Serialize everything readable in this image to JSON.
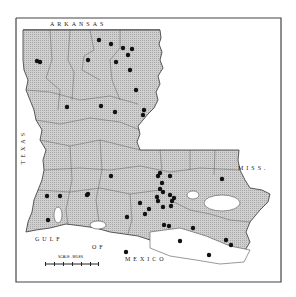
{
  "map": {
    "title": "",
    "labels": {
      "north": "ARKANSAS",
      "west": "TEXAS",
      "east": "MISS.",
      "gulf_1": "GULF",
      "gulf_2": "OF",
      "gulf_3": "MEXICO"
    },
    "scale": {
      "label": "SCALE - MILES"
    },
    "colors": {
      "land": "#c8c8c8",
      "border": "#333333",
      "dot": "#111111",
      "water": "#ffffff",
      "frame": "#444444"
    },
    "dots": [
      [
        99,
        40
      ],
      [
        111,
        44
      ],
      [
        123,
        48
      ],
      [
        132,
        49
      ],
      [
        128,
        55
      ],
      [
        116,
        62
      ],
      [
        130,
        70
      ],
      [
        136,
        90
      ],
      [
        88,
        60
      ],
      [
        40,
        62
      ],
      [
        37,
        61
      ],
      [
        67,
        107
      ],
      [
        101,
        106
      ],
      [
        115,
        112
      ],
      [
        144,
        110
      ],
      [
        143,
        115
      ],
      [
        111,
        176
      ],
      [
        88,
        194
      ],
      [
        158,
        176
      ],
      [
        160,
        173
      ],
      [
        170,
        176
      ],
      [
        162,
        183
      ],
      [
        160,
        189
      ],
      [
        163,
        192
      ],
      [
        157,
        197
      ],
      [
        170,
        195
      ],
      [
        174,
        198
      ],
      [
        172,
        201
      ],
      [
        158,
        201
      ],
      [
        163,
        207
      ],
      [
        171,
        206
      ],
      [
        149,
        209
      ],
      [
        140,
        203
      ],
      [
        145,
        214
      ],
      [
        164,
        225
      ],
      [
        169,
        226
      ],
      [
        222,
        179
      ],
      [
        193,
        228
      ],
      [
        180,
        241
      ],
      [
        226,
        240
      ],
      [
        231,
        245
      ],
      [
        47,
        196
      ],
      [
        60,
        196
      ],
      [
        87,
        195
      ],
      [
        48,
        220
      ],
      [
        127,
        217
      ],
      [
        209,
        255
      ],
      [
        126,
        252
      ]
    ]
  }
}
